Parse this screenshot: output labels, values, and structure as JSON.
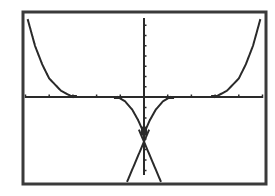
{
  "calculator": {
    "screen": "graph",
    "window": {
      "xmin": -5,
      "xmax": 5,
      "xscl": 1,
      "ymin": -8,
      "ymax": 8,
      "yscl": 1
    },
    "colors": {
      "background": "#ffffff",
      "ink": "#2a2a2a",
      "frame": "#3a3a3a"
    }
  },
  "chart_data": {
    "type": "line",
    "title": "",
    "xlabel": "",
    "ylabel": "",
    "xlim": [
      -5,
      5
    ],
    "ylim": [
      -8,
      8
    ],
    "grid": false,
    "axes_ticks": {
      "x": [
        -5,
        -4,
        -3,
        -2,
        -1,
        1,
        2,
        3,
        4,
        5
      ],
      "y": [
        -7,
        -6,
        -5,
        -4,
        -3,
        -2,
        -1,
        1,
        2,
        3,
        4,
        5,
        6,
        7
      ]
    },
    "series": [
      {
        "name": "Y1 outer right",
        "points": [
          [
            3,
            0
          ],
          [
            3.5,
            0.6
          ],
          [
            4,
            1.8
          ],
          [
            4.3,
            3.2
          ],
          [
            4.6,
            5.0
          ],
          [
            4.9,
            7.5
          ]
        ]
      },
      {
        "name": "Y1 outer left",
        "points": [
          [
            -3,
            0
          ],
          [
            -3.5,
            0.6
          ],
          [
            -4,
            1.8
          ],
          [
            -4.3,
            3.2
          ],
          [
            -4.6,
            5.0
          ],
          [
            -4.9,
            7.5
          ]
        ]
      },
      {
        "name": "Y2 inner right",
        "points": [
          [
            1.1,
            0
          ],
          [
            0.8,
            -0.4
          ],
          [
            0.5,
            -1.2
          ],
          [
            0.25,
            -2.2
          ],
          [
            0.05,
            -3.2
          ]
        ]
      },
      {
        "name": "Y2 inner left",
        "points": [
          [
            -1.1,
            0
          ],
          [
            -0.8,
            -0.4
          ],
          [
            -0.5,
            -1.2
          ],
          [
            -0.25,
            -2.2
          ],
          [
            -0.05,
            -3.2
          ]
        ]
      },
      {
        "name": "Y3 line right",
        "points": [
          [
            -0.2,
            -3.2
          ],
          [
            0.7,
            -8
          ]
        ]
      },
      {
        "name": "Y3 line left",
        "points": [
          [
            0.2,
            -3.2
          ],
          [
            -0.7,
            -8
          ]
        ]
      }
    ]
  }
}
